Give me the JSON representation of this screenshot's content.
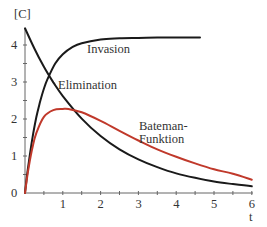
{
  "chart_data": {
    "type": "line",
    "title": "",
    "xlabel": "t",
    "ylabel": "[C]",
    "xlim": [
      0,
      6
    ],
    "ylim": [
      0,
      4.5
    ],
    "x_ticks": [
      "1",
      "2",
      "3",
      "4",
      "5",
      "6"
    ],
    "y_ticks": [
      "0",
      "1",
      "2",
      "3",
      "4"
    ],
    "grid": false,
    "legend": "inline labels",
    "series": [
      {
        "name": "Invasion",
        "color": "#1a1a1a",
        "x": [
          0,
          0.05,
          0.1,
          0.2,
          0.3,
          0.4,
          0.5,
          0.6,
          0.8,
          1.0,
          1.25,
          1.5,
          2.0,
          2.5,
          3.0,
          3.5,
          4.0,
          4.63
        ],
        "values": [
          0.0,
          0.45,
          0.83,
          1.51,
          2.05,
          2.47,
          2.82,
          3.09,
          3.5,
          3.75,
          3.94,
          4.05,
          4.15,
          4.18,
          4.19,
          4.2,
          4.2,
          4.2
        ]
      },
      {
        "name": "Elimination",
        "color": "#1a1a1a",
        "x": [
          0,
          0.25,
          0.5,
          0.75,
          1.0,
          1.5,
          2.0,
          2.5,
          3.0,
          3.5,
          4.0,
          4.5,
          5.0,
          5.5,
          6.0
        ],
        "values": [
          4.45,
          3.9,
          3.41,
          2.99,
          2.62,
          2.01,
          1.54,
          1.18,
          0.91,
          0.7,
          0.53,
          0.41,
          0.31,
          0.24,
          0.18
        ]
      },
      {
        "name": "Bateman-Funktion",
        "color": "#c0392b",
        "x": [
          0,
          0.05,
          0.1,
          0.2,
          0.3,
          0.5,
          0.75,
          1.0,
          1.15,
          1.5,
          2.0,
          2.5,
          3.0,
          3.5,
          4.0,
          4.5,
          5.0,
          5.5,
          6.0
        ],
        "values": [
          0.0,
          0.38,
          0.71,
          1.24,
          1.62,
          2.06,
          2.24,
          2.27,
          2.27,
          2.18,
          1.95,
          1.68,
          1.42,
          1.18,
          0.98,
          0.8,
          0.64,
          0.52,
          0.36
        ]
      }
    ],
    "annotations": [
      {
        "text": "Invasion",
        "x": 1.6,
        "y": 3.75
      },
      {
        "text": "Elimination",
        "x": 0.85,
        "y": 2.8
      },
      {
        "text": "Bateman-",
        "x": 3.0,
        "y": 1.7
      },
      {
        "text": "Funktion",
        "x": 3.0,
        "y": 1.33
      }
    ]
  },
  "labels": {
    "y_axis": "[C]",
    "x_axis": "t",
    "invasion": "Invasion",
    "elimination": "Elimination",
    "bateman_1": "Bateman-",
    "bateman_2": "Funktion"
  }
}
